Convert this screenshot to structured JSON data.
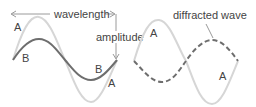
{
  "diagram": {
    "labels": {
      "wavelength": "wavelength",
      "amplitude": "amplitude",
      "diffracted_wave": "diffracted wave",
      "wave_a": "A",
      "wave_b": "B"
    },
    "colors": {
      "wave_a": "#d4d4d4",
      "wave_b": "#6e6e6e",
      "diffracted": "#6e6e6e",
      "arrow": "#9a9a9a",
      "text": "#444444"
    },
    "left_panel": {
      "waves": [
        {
          "name": "A",
          "style": "solid-light",
          "amplitude": "large"
        },
        {
          "name": "B",
          "style": "solid-dark",
          "amplitude": "small"
        }
      ]
    },
    "right_panel": {
      "waves": [
        {
          "name": "A",
          "style": "solid-light"
        },
        {
          "name": "diffracted wave",
          "style": "dashed-dark",
          "phase": "shifted"
        }
      ]
    }
  }
}
